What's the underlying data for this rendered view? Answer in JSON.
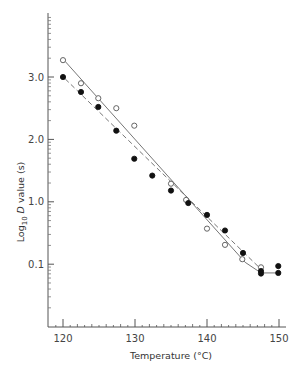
{
  "chart_data": {
    "type": "scatter",
    "title": "",
    "xlabel": "Temperature (°C)",
    "ylabel": "Log10 D value (s)",
    "ylabel_parts": {
      "prefix": "Log",
      "sub": "10",
      "italic": "D",
      "suffix": " value (s)"
    },
    "xlim": [
      118,
      151
    ],
    "x_ticks": [
      120,
      130,
      140,
      150
    ],
    "x_tick_labels": [
      "120",
      "130",
      "140",
      "150"
    ],
    "y_ticks_position": [
      3.0,
      2.0,
      1.0,
      0.0
    ],
    "y_tick_labels": [
      "3.0",
      "2.0",
      "1.0",
      "0.1"
    ],
    "ylim_position": [
      -1.0,
      3.9
    ],
    "grid": false,
    "legend": null,
    "series": [
      {
        "name": "open circles",
        "marker": "open-circle",
        "line": "solid",
        "x": [
          120,
          122.5,
          124.9,
          127.4,
          129.9,
          135.0,
          137.1,
          140.0,
          142.5,
          144.9,
          147.5
        ],
        "values": [
          3.27,
          2.9,
          2.66,
          2.5,
          2.22,
          1.29,
          1.03,
          0.57,
          0.31,
          0.08,
          -0.05
        ]
      },
      {
        "name": "filled circles",
        "marker": "filled-circle",
        "line": "dashed",
        "x": [
          120,
          122.5,
          124.9,
          127.4,
          129.9,
          132.4,
          135.0,
          137.4,
          140.0,
          142.5,
          145.0,
          147.5,
          147.5,
          149.9,
          149.9
        ],
        "values": [
          3.0,
          2.76,
          2.52,
          2.14,
          1.69,
          1.42,
          1.18,
          0.98,
          0.79,
          0.54,
          0.18,
          -0.11,
          -0.15,
          -0.03,
          -0.14
        ]
      }
    ],
    "fit_lines": [
      {
        "name": "solid fit",
        "style": "solid",
        "points": [
          [
            120.3,
            3.25
          ],
          [
            145.3,
            0.03
          ],
          [
            147.5,
            -0.14
          ],
          [
            149.9,
            -0.14
          ]
        ]
      },
      {
        "name": "dashed fit",
        "style": "dashed",
        "points": [
          [
            120.3,
            2.97
          ],
          [
            147.5,
            -0.08
          ]
        ]
      }
    ]
  }
}
